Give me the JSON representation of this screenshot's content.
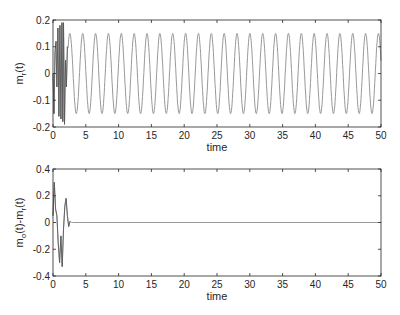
{
  "chart_data": [
    {
      "type": "line",
      "title": "",
      "xlabel": "time",
      "ylabel": "m_r(t)",
      "xlim": [
        0,
        50
      ],
      "ylim": [
        -0.2,
        0.2
      ],
      "xticks": [
        "0",
        "5",
        "10",
        "15",
        "20",
        "25",
        "30",
        "35",
        "40",
        "45",
        "50"
      ],
      "yticks": [
        "-0.2",
        "-0.1",
        "0",
        "0.1",
        "0.2"
      ],
      "grid": false,
      "series": [
        {
          "name": "m_r(t)",
          "description": "initial transient oscillations up to ~±0.19 for t<2.5, then steady sinusoid amplitude 0.15, period ~1.96",
          "amplitude": 0.15,
          "period": 1.96,
          "color": "#999999"
        }
      ]
    },
    {
      "type": "line",
      "title": "",
      "xlabel": "time",
      "ylabel": "m_o(t)-m_r(t)",
      "xlim": [
        0,
        50
      ],
      "ylim": [
        -0.4,
        0.4
      ],
      "xticks": [
        "0",
        "5",
        "10",
        "15",
        "20",
        "25",
        "30",
        "35",
        "40",
        "45",
        "50"
      ],
      "yticks": [
        "-0.4",
        "-0.2",
        "0",
        "0.2",
        "0.4"
      ],
      "grid": false,
      "series": [
        {
          "name": "error",
          "description": "transient peaking ~0.3 and ~-0.34 for t<3, then settles to 0",
          "x": [
            0,
            0.2,
            0.4,
            0.6,
            0.8,
            1.0,
            1.2,
            1.4,
            1.6,
            1.8,
            2.0,
            2.2,
            2.4,
            2.6,
            2.8,
            3.0,
            50
          ],
          "y": [
            0.05,
            0.3,
            0.1,
            0.05,
            -0.15,
            -0.3,
            -0.1,
            -0.33,
            -0.05,
            0.12,
            0.18,
            0.05,
            -0.03,
            0.01,
            0.0,
            0.0,
            0.0
          ],
          "color": "#999999"
        }
      ]
    }
  ],
  "plots": {
    "top": {
      "ylabel_main": "m",
      "ylabel_sub": "r",
      "ylabel_tail": "(t)",
      "xlabel": "time"
    },
    "bottom": {
      "ylabel_main": "m",
      "ylabel_sub1": "o",
      "ylabel_mid": "(t)-m",
      "ylabel_sub2": "r",
      "ylabel_tail": "(t)",
      "xlabel": "time"
    }
  }
}
